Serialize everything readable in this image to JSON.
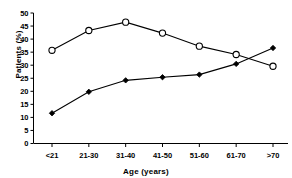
{
  "chart_data": {
    "type": "line",
    "title": "",
    "xlabel": "Age (years)",
    "ylabel": "Patients (%)",
    "categories": [
      "<21",
      "21-30",
      "31-40",
      "41-50",
      "51-60",
      "61-70",
      ">70"
    ],
    "ylim": [
      0,
      50
    ],
    "yticks": [
      0,
      5,
      10,
      15,
      20,
      25,
      30,
      35,
      40,
      45,
      50
    ],
    "grid": false,
    "legend": "none",
    "series": [
      {
        "name": "open-circle-series",
        "marker": "open-circle",
        "color": "#000000",
        "values": [
          35.7,
          43.3,
          46.5,
          42.3,
          37.3,
          34.1,
          29.6
        ]
      },
      {
        "name": "filled-diamond-series",
        "marker": "filled-diamond",
        "color": "#000000",
        "values": [
          11.6,
          19.8,
          24.2,
          25.4,
          26.4,
          30.5,
          36.6
        ]
      }
    ]
  },
  "axis": {
    "y_title": "Patients (%)",
    "x_title": "Age (years)",
    "y_tick_labels": [
      "50",
      "45",
      "40",
      "35",
      "30",
      "25",
      "20",
      "15",
      "10",
      "5",
      "0"
    ],
    "x_tick_labels": [
      "<21",
      "21-30",
      "31-40",
      "41-50",
      "51-60",
      "61-70",
      ">70"
    ]
  }
}
